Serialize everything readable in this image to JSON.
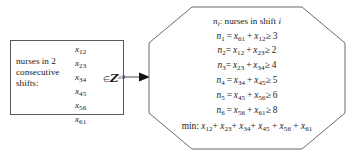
{
  "diagram": {
    "left_box": {
      "label_lines": [
        "nurses in 2",
        "consecutive",
        "shifts:"
      ],
      "variables": [
        "x12",
        "x23",
        "x34",
        "x45",
        "x56",
        "x61"
      ],
      "variable_parts": [
        {
          "base": "x",
          "sub": "12"
        },
        {
          "base": "x",
          "sub": "23"
        },
        {
          "base": "x",
          "sub": "34"
        },
        {
          "base": "x",
          "sub": "45"
        },
        {
          "base": "x",
          "sub": "56"
        },
        {
          "base": "x",
          "sub": "61"
        }
      ],
      "membership": {
        "symbol": "∈",
        "set": "Z",
        "superscript": "≥0",
        "full": "∈ Z≥0"
      }
    },
    "arrow": {
      "direction": "right",
      "name": "flow-arrow"
    },
    "octagon": {
      "header": {
        "symbol": "n",
        "symbol_sub": "i",
        "text": ": nurses in shift ",
        "trailing_italic": "i",
        "full": "n_i : nurses in shift i"
      },
      "constraints": [
        {
          "lhs": "n",
          "lhs_sub": "1",
          "term1": "x",
          "term1_sub": "61",
          "term2": "x",
          "term2_sub": "12",
          "rel": "≥",
          "rhs": "3",
          "full": "n1 = x61 + x12 ≥ 3"
        },
        {
          "lhs": "n",
          "lhs_sub": "2",
          "term1": "x",
          "term1_sub": "12",
          "term2": "x",
          "term2_sub": "23",
          "rel": "≥",
          "rhs": "2",
          "full": "n2 = x12 + x23 ≥ 2"
        },
        {
          "lhs": "n",
          "lhs_sub": "3",
          "term1": "x",
          "term1_sub": "23",
          "term2": "x",
          "term2_sub": "34",
          "rel": "≥",
          "rhs": "4",
          "full": "n3 = x23 + x34 ≥ 4"
        },
        {
          "lhs": "n",
          "lhs_sub": "4",
          "term1": "x",
          "term1_sub": "34",
          "term2": "x",
          "term2_sub": "45",
          "rel": "≥",
          "rhs": "5",
          "full": "n4 = x34 + x45 ≥ 5"
        },
        {
          "lhs": "n",
          "lhs_sub": "5",
          "term1": "x",
          "term1_sub": "45",
          "term2": "x",
          "term2_sub": "56",
          "rel": "≥",
          "rhs": "6",
          "full": "n5 = x45 + x56 ≥ 6"
        },
        {
          "lhs": "n",
          "lhs_sub": "6",
          "term1": "x",
          "term1_sub": "56",
          "term2": "x",
          "term2_sub": "61",
          "rel": "≥",
          "rhs": "8",
          "full": "n6 = x56 + x61 ≥ 8"
        }
      ],
      "objective": {
        "prefix": "min:",
        "terms": [
          "x12",
          "x23",
          "x34",
          "x45",
          "x56",
          "x61"
        ],
        "full": "min: x12+ x23+ x34+ x45 + x56 + x61"
      }
    },
    "colors": {
      "stroke": "#5a5a5a",
      "text": "#1a1a1a",
      "background": "#ffffff"
    }
  }
}
